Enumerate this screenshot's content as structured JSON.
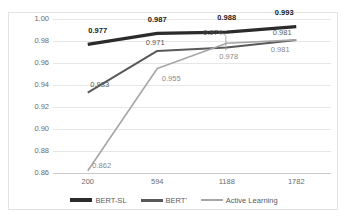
{
  "chart_data": {
    "type": "line",
    "title": "",
    "xlabel": "",
    "ylabel": "",
    "categories": [
      "200",
      "594",
      "1188",
      "1782"
    ],
    "ylim": [
      0.86,
      1.0
    ],
    "yticks": [
      "1.00",
      "0.98",
      "0.96",
      "0.94",
      "0.92",
      "0.90",
      "0.88",
      "0.86"
    ],
    "ytick_values": [
      1.0,
      0.98,
      0.96,
      0.94,
      0.92,
      0.9,
      0.88,
      0.86
    ],
    "grid": true,
    "legend_position": "bottom",
    "series": [
      {
        "name": "BERT-SL",
        "color": "#2b2b2b",
        "width": 3.2,
        "values": [
          0.977,
          0.987,
          0.988,
          0.993
        ],
        "labels": [
          "0.977",
          "0.987",
          "0.988",
          "0.993"
        ],
        "label_style": "bold"
      },
      {
        "name": "BERT'",
        "color": "#595959",
        "width": 2.0,
        "values": [
          0.933,
          0.971,
          0.974,
          0.981
        ],
        "labels": [
          "0.933",
          "0.971",
          "0.974",
          "0.981"
        ],
        "label_style": "mid"
      },
      {
        "name": "Active Learning",
        "color": "#a6a6a6",
        "width": 1.6,
        "values": [
          0.862,
          0.955,
          0.978,
          0.981
        ],
        "labels": [
          "0.862",
          "0.955",
          "0.978",
          "0.981"
        ],
        "label_style": "light"
      }
    ]
  },
  "legend": {
    "items": [
      {
        "label": "BERT-SL",
        "color": "#2b2b2b",
        "thickness": "4px"
      },
      {
        "label": "BERT'",
        "color": "#595959",
        "thickness": "3px"
      },
      {
        "label": "Active Learning",
        "color": "#a6a6a6",
        "thickness": "2px"
      }
    ]
  },
  "label_positions": {
    "bert_sl": [
      {
        "text": "0.977",
        "x": 0,
        "dx": 10,
        "dy": -14
      },
      {
        "text": "0.987",
        "x": 1,
        "dx": 0,
        "dy": -14
      },
      {
        "text": "0.988",
        "x": 2,
        "dx": 0,
        "dy": -15
      },
      {
        "text": "0.993",
        "x": 3,
        "dx": -12,
        "dy": -15
      }
    ],
    "bert_prime": [
      {
        "text": "0.933",
        "x": 0,
        "dx": 12,
        "dy": -9
      },
      {
        "text": "0.971",
        "x": 1,
        "dx": -2,
        "dy": -9
      },
      {
        "text": "0.974",
        "x": 2,
        "dx": -14,
        "dy": -16
      },
      {
        "text": "0.981",
        "x": 3,
        "dx": -14,
        "dy": -8
      }
    ],
    "active_learning": [
      {
        "text": "0.862",
        "x": 0,
        "dx": 14,
        "dy": -6
      },
      {
        "text": "0.955",
        "x": 1,
        "dx": 14,
        "dy": 9
      },
      {
        "text": "0.978",
        "x": 2,
        "dx": 2,
        "dy": 13
      },
      {
        "text": "0.981",
        "x": 3,
        "dx": -16,
        "dy": 9
      }
    ]
  }
}
